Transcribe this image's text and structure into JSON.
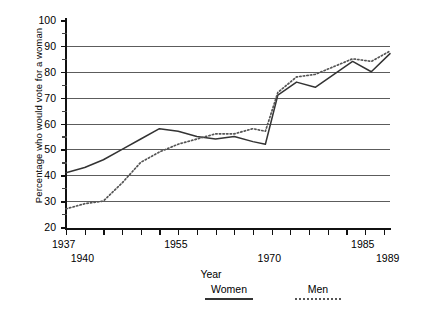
{
  "chart_data": {
    "type": "line",
    "title": "",
    "xlabel": "Year",
    "ylabel": "Percentage who would vote for a woman",
    "xlim": [
      1937,
      1989
    ],
    "ylim": [
      20,
      100
    ],
    "yticks": [
      20,
      30,
      40,
      50,
      60,
      70,
      80,
      90,
      100
    ],
    "yticks_minor": [
      25,
      35,
      45,
      55,
      65,
      75,
      85,
      95
    ],
    "grid": "horizontal",
    "gridlines_at": [
      30,
      40,
      50,
      60,
      70,
      80,
      90
    ],
    "xtick_labels": [
      "1937",
      "1940",
      "1955",
      "1970",
      "1985",
      "1989"
    ],
    "legend_position": "bottom",
    "x": [
      1937,
      1940,
      1943,
      1946,
      1949,
      1952,
      1955,
      1958,
      1961,
      1964,
      1967,
      1969,
      1971,
      1974,
      1977,
      1980,
      1983,
      1986,
      1989
    ],
    "series": [
      {
        "name": "Women",
        "style": "solid",
        "color": "#333333",
        "values": [
          41,
          43,
          46,
          50,
          54,
          58,
          57,
          55,
          54,
          55,
          53,
          52,
          71,
          76,
          74,
          79,
          84,
          80,
          87
        ]
      },
      {
        "name": "Men",
        "style": "dotted",
        "color": "#555555",
        "values": [
          27,
          29,
          30,
          37,
          45,
          49,
          52,
          54,
          56,
          56,
          58,
          57,
          72,
          78,
          79,
          82,
          85,
          84,
          88
        ]
      }
    ]
  },
  "axes": {
    "ylabel_text": "Percentage who would vote for a woman",
    "xlabel_text": "Year",
    "ytick_labels": [
      "100",
      "90",
      "80",
      "70",
      "60",
      "50",
      "40",
      "30",
      "20"
    ],
    "xtick_marks": [
      {
        "label": "1937",
        "value": 1937,
        "row": 0
      },
      {
        "label": "1940",
        "value": 1940,
        "row": 1
      },
      {
        "label": "1955",
        "value": 1955,
        "row": 0
      },
      {
        "label": "1970",
        "value": 1970,
        "row": 1
      },
      {
        "label": "1985",
        "value": 1985,
        "row": 0
      },
      {
        "label": "1989",
        "value": 1989,
        "row": 1
      }
    ]
  },
  "legend": {
    "items": [
      {
        "label": "Women",
        "style": "solid"
      },
      {
        "label": "Men",
        "style": "dotted"
      }
    ]
  },
  "caption": {
    "text": ""
  }
}
